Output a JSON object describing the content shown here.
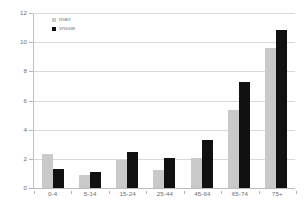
{
  "chart_data": {
    "type": "bar",
    "title": "",
    "subtitle": "",
    "xlabel": "",
    "ylabel": "",
    "categories": [
      "0-4",
      "5-14",
      "15-24",
      "25-44",
      "45-64",
      "65-74",
      "75+"
    ],
    "series": [
      {
        "name": "man",
        "color": "#c9c9c9",
        "values": [
          2.35,
          0.9,
          1.9,
          1.25,
          2.05,
          5.35,
          9.6
        ]
      },
      {
        "name": "vrouw",
        "color": "#111111",
        "values": [
          1.3,
          1.1,
          2.5,
          2.05,
          3.3,
          7.25,
          10.85
        ]
      }
    ],
    "ylim": [
      0,
      12
    ],
    "yticks": [
      0,
      2,
      4,
      6,
      8,
      10,
      12
    ],
    "ytick_labels": [
      "0",
      "2",
      "4",
      "6",
      "8",
      "10",
      "12"
    ],
    "grid": true,
    "grid_axis": "y",
    "legend_position": "top-left",
    "background": "#ffffff"
  },
  "legend": {
    "entries": [
      {
        "label": "man",
        "swatch": "man-swatch"
      },
      {
        "label": "vrouw",
        "swatch": "vrouw-swatch"
      }
    ]
  }
}
